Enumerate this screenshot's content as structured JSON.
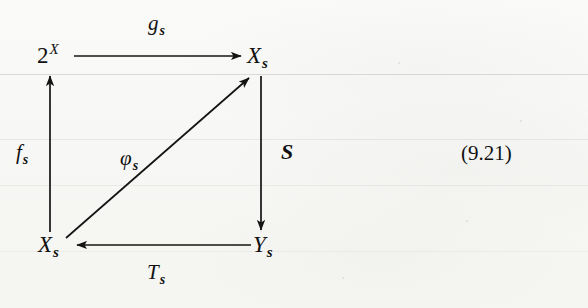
{
  "page": {
    "background_color": "#f7f7f5",
    "ink_color": "#141414"
  },
  "diagram": {
    "type": "commutative-diagram",
    "nodes": [
      {
        "id": "top-left",
        "base": "2",
        "sup": "X",
        "sub": "",
        "label": "2^X",
        "x": 52,
        "y": 56
      },
      {
        "id": "top-right",
        "base": "X",
        "sup": "",
        "sub": "s",
        "label": "X_s",
        "x": 258,
        "y": 56
      },
      {
        "id": "bottom-left",
        "base": "X",
        "sup": "",
        "sub": "s",
        "label": "X_s",
        "x": 52,
        "y": 245
      },
      {
        "id": "bottom-right",
        "base": "Y",
        "sup": "",
        "sub": "s",
        "label": "Y_s",
        "x": 258,
        "y": 245
      }
    ],
    "arrows": [
      {
        "id": "top-arrow",
        "from": "top-left",
        "to": "top-right",
        "label_base": "g",
        "label_sub": "s",
        "label": "g_s",
        "direction": "right"
      },
      {
        "id": "left-arrow",
        "from": "bottom-left",
        "to": "top-left",
        "label_base": "f",
        "label_sub": "s",
        "label": "f_s",
        "direction": "up"
      },
      {
        "id": "right-arrow",
        "from": "top-right",
        "to": "bottom-right",
        "label_base": "S",
        "label_sub": "",
        "label": "S",
        "direction": "down"
      },
      {
        "id": "bottom-arrow",
        "from": "bottom-right",
        "to": "bottom-left",
        "label_base": "T",
        "label_sub": "s",
        "label": "T_s",
        "direction": "left"
      },
      {
        "id": "diagonal-arrow",
        "from": "bottom-left",
        "to": "top-right",
        "label_base": "φ",
        "label_sub": "s",
        "label": "φ_s",
        "direction": "up-right"
      }
    ],
    "labels": {
      "g_base": "g",
      "g_sub": "s",
      "f_base": "f",
      "f_sub": "s",
      "S_base": "S",
      "T_base": "T",
      "T_sub": "s",
      "phi_base": "φ",
      "phi_sub": "s",
      "two_base": "2",
      "two_sup": "X",
      "X_base": "X",
      "X_sub": "s",
      "Y_base": "Y",
      "Y_sub": "s"
    }
  },
  "equation_number": "(9.21)"
}
